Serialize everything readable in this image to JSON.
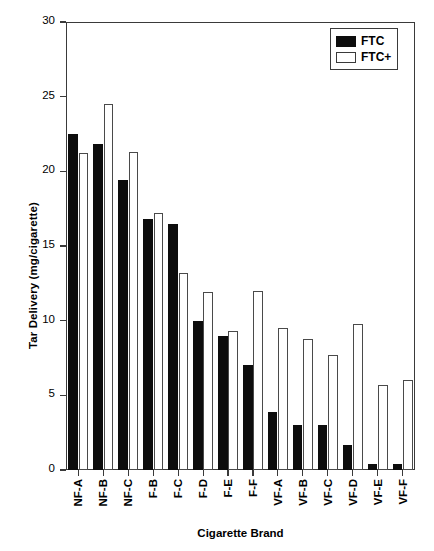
{
  "chart_data": {
    "type": "bar",
    "title": "",
    "xlabel": "Cigarette Brand",
    "ylabel": "Tar Delivery (mg/cigarette)",
    "ylim": [
      0,
      30
    ],
    "yticks": [
      0,
      5,
      10,
      15,
      20,
      25,
      30
    ],
    "ytick_labels": [
      "0",
      "5",
      "10",
      "15",
      "20",
      "25",
      "30"
    ],
    "grid": false,
    "legend_position": "top-right",
    "legend": [
      "FTC",
      "FTC+"
    ],
    "categories": [
      "NF-A",
      "NF-B",
      "NF-C",
      "F-B",
      "F-C",
      "F-D",
      "F-E",
      "F-F",
      "VF-A",
      "VF-B",
      "VF-C",
      "VF-D",
      "VF-E",
      "VF-F"
    ],
    "series": [
      {
        "name": "FTC",
        "color": "#0d0d0d",
        "fill": "solid",
        "values": [
          22.5,
          21.8,
          19.4,
          16.8,
          16.5,
          10.0,
          9.0,
          7.0,
          3.9,
          3.0,
          3.0,
          1.7,
          0.4,
          0.4
        ]
      },
      {
        "name": "FTC+",
        "color": "#ffffff",
        "fill": "open",
        "values": [
          21.2,
          24.5,
          21.3,
          17.2,
          13.2,
          11.9,
          9.3,
          12.0,
          9.5,
          8.8,
          7.7,
          9.8,
          5.7,
          6.0
        ]
      }
    ]
  },
  "colors": {
    "ftc": "#0d0d0d",
    "ftcplus": "#ffffff",
    "axis": "#3a3a3a",
    "background": "#ffffff"
  }
}
